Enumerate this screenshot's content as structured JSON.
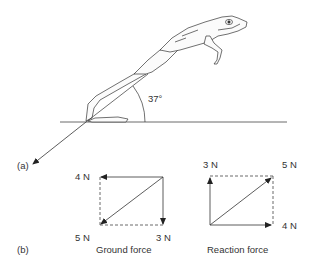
{
  "part_a": {
    "label": "(a)",
    "angle_label": "37°",
    "angle_degrees": 37
  },
  "part_b": {
    "label": "(b)",
    "ground_force": {
      "caption": "Ground force",
      "horizontal": "4 N",
      "resultant": "5 N",
      "vertical": "3 N"
    },
    "reaction_force": {
      "caption": "Reaction force",
      "vertical": "3 N",
      "resultant": "5 N",
      "horizontal": "4 N"
    }
  }
}
